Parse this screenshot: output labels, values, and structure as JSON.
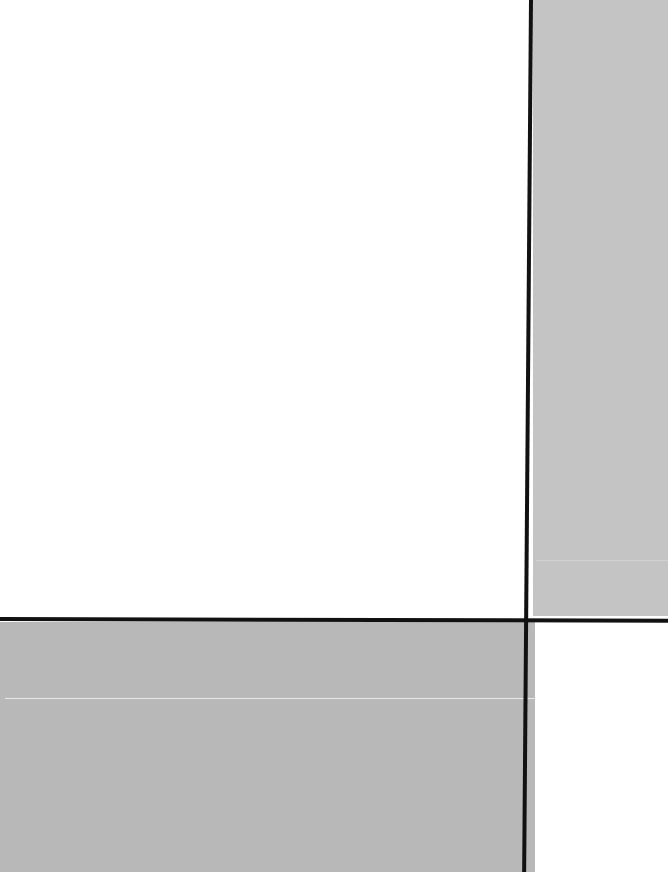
{
  "artwork": {
    "style": "geometric abstract composition",
    "colors": {
      "white": "#ffffff",
      "light_gray": "#c4c4c4",
      "mid_gray": "#b8b8b8",
      "line_black": "#111111"
    },
    "regions": [
      {
        "name": "large-white-field",
        "color": "#ffffff"
      },
      {
        "name": "right-gray-field",
        "color": "#c4c4c4"
      },
      {
        "name": "bottom-gray-field",
        "color": "#b8b8b8"
      },
      {
        "name": "bottom-right-white-field",
        "color": "#ffffff"
      }
    ]
  }
}
